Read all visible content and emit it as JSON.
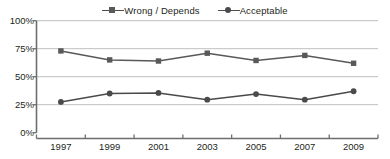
{
  "chart_data": {
    "type": "line",
    "title": "",
    "subtitle": "",
    "xlabel": "",
    "ylabel": "",
    "categories": [
      "1997",
      "1999",
      "2001",
      "2003",
      "2005",
      "2007",
      "2009"
    ],
    "series": [
      {
        "name": "Wrong / Depends",
        "marker": "square",
        "color": "#595959",
        "values": [
          73,
          65,
          64,
          71,
          64.5,
          69,
          62
        ]
      },
      {
        "name": "Acceptable",
        "marker": "circle",
        "color": "#4a4a4a",
        "values": [
          27.5,
          35,
          35.5,
          29.5,
          34.5,
          29.5,
          37
        ]
      }
    ],
    "ylim": [
      0,
      100
    ],
    "yticks": [
      0,
      25,
      50,
      75,
      100
    ],
    "ytick_labels": [
      "0%",
      "25%",
      "50%",
      "75%",
      "100%"
    ],
    "grid": "horizontal",
    "legend_position": "top-center",
    "annotations": []
  },
  "legend": {
    "entries": [
      {
        "label": "Wrong / Depends"
      },
      {
        "label": "Acceptable"
      }
    ]
  },
  "colors": {
    "grid": "#bfbfbf",
    "axis": "#6e6e6e",
    "series_wrong": "#595959",
    "series_acceptable": "#4a4a4a",
    "text": "#231f20",
    "background": "#ffffff"
  }
}
